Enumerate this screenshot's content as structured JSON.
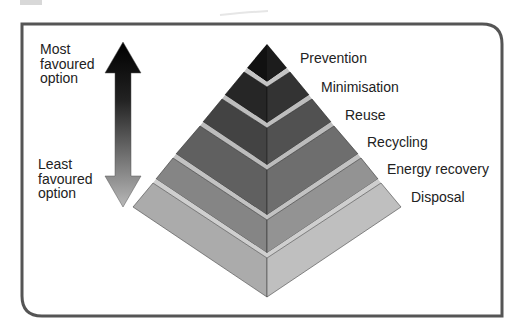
{
  "diagram": {
    "scale": {
      "top_label": [
        "Most",
        "favoured",
        "option"
      ],
      "bottom_label": [
        "Least",
        "favoured",
        "option"
      ]
    },
    "tiers": [
      {
        "label": "Prevention",
        "rank": 1,
        "color": "#141414"
      },
      {
        "label": "Minimisation",
        "rank": 2,
        "color": "#2c2c2c"
      },
      {
        "label": "Reuse",
        "rank": 3,
        "color": "#4a4a4a"
      },
      {
        "label": "Recycling",
        "rank": 4,
        "color": "#6a6a6a"
      },
      {
        "label": "Energy recovery",
        "rank": 5,
        "color": "#8c8c8c"
      },
      {
        "label": "Disposal",
        "rank": 6,
        "color": "#b4b4b4"
      }
    ],
    "colors": {
      "frame": "#555555",
      "band": "#c8c8c8",
      "arrow_top": "#000000",
      "arrow_bottom": "#b0b0b0"
    }
  }
}
